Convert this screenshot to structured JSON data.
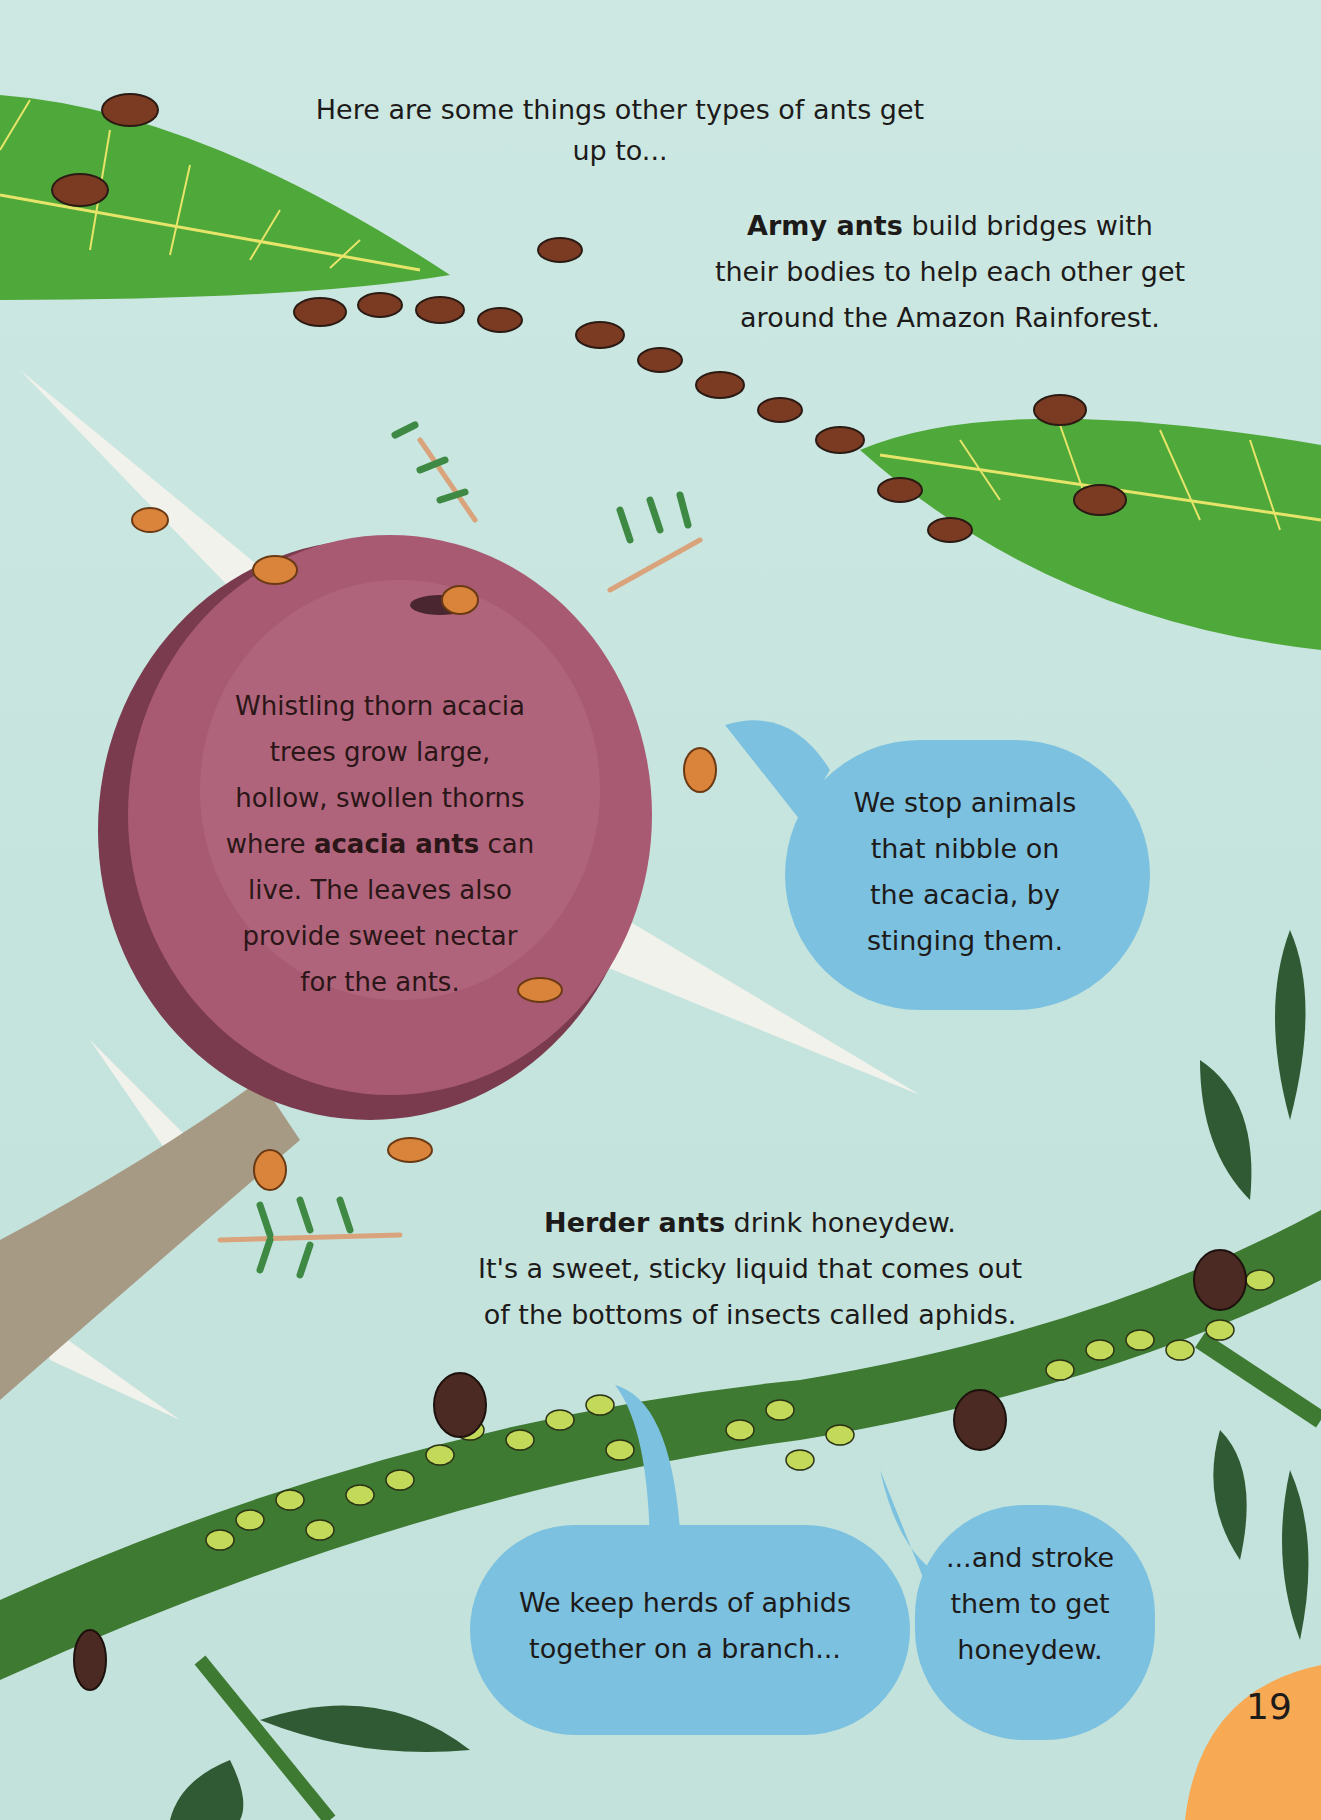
{
  "page": {
    "number": "19",
    "background_color": "#c9e6e0",
    "accent_colors": {
      "leaf_green": "#4fa83a",
      "thorn_pink": "#a85a73",
      "bubble_blue": "#7cc1df",
      "page_tab_orange": "#f7a953",
      "ant_brown": "#7a3b22",
      "aphid_green": "#c3d95a",
      "branch_green": "#3f7a32"
    }
  },
  "intro": {
    "text": "Here are some things other types of ants get up to..."
  },
  "army_ants": {
    "bold": "Army ants",
    "line1_rest": " build bridges with",
    "line2": "their bodies to help each other get",
    "line3": "around the Amazon Rainforest."
  },
  "acacia": {
    "line1": "Whistling thorn acacia",
    "line2": "trees grow large,",
    "line3": "hollow, swollen thorns",
    "line4_pre": "where ",
    "line4_bold": "acacia ants",
    "line4_post": " can",
    "line5": "live. The leaves also",
    "line6": "provide sweet nectar",
    "line7": "for the ants."
  },
  "acacia_bubble": {
    "line1": "We stop animals",
    "line2": "that nibble on",
    "line3": "the acacia, by",
    "line4": "stinging them."
  },
  "herder_ants": {
    "bold": "Herder ants",
    "line1_rest": " drink honeydew.",
    "line2": "It's a sweet, sticky liquid that comes out",
    "line3": "of the bottoms of insects called aphids."
  },
  "herder_bubble_1": {
    "line1": "We keep herds of aphids",
    "line2": "together on a branch..."
  },
  "herder_bubble_2": {
    "line1": "...and stroke",
    "line2": "them to get",
    "line3": "honeydew."
  },
  "illustrations": [
    "army-ant-bridge",
    "acacia-thorn-bulb",
    "acacia-ants",
    "herder-ants",
    "aphids",
    "green-branch",
    "leaves"
  ]
}
